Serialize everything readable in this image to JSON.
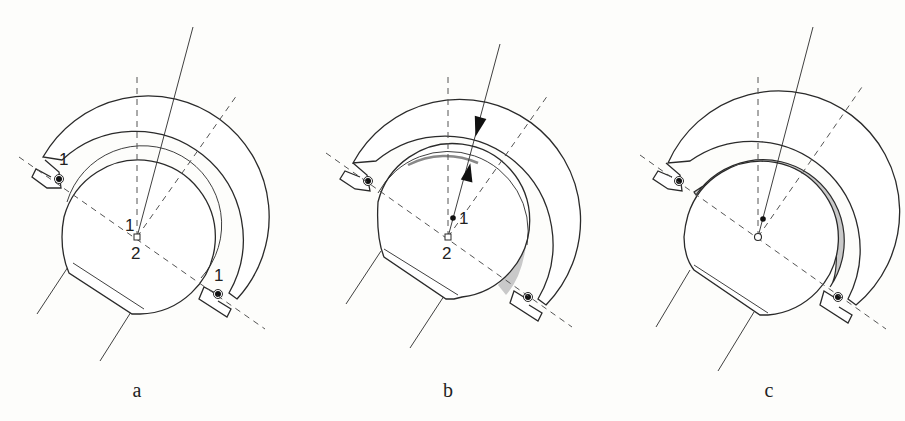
{
  "figure": {
    "panels": [
      {
        "id": "a",
        "caption": "a",
        "center": [
          137,
          237
        ],
        "labels": {
          "point_1": "1",
          "point_2": "2",
          "lug_left": "1",
          "lug_right": "1"
        }
      },
      {
        "id": "b",
        "caption": "b",
        "center": [
          448,
          237
        ],
        "labels": {
          "point_1": "1",
          "point_2": "2"
        }
      },
      {
        "id": "c",
        "caption": "c",
        "center": [
          758,
          237
        ],
        "labels": {}
      }
    ],
    "colors": {
      "line": "#2a2a2a",
      "dash": "#555555",
      "shade": "#c9c9c9",
      "background": "#fdfdfb"
    }
  }
}
